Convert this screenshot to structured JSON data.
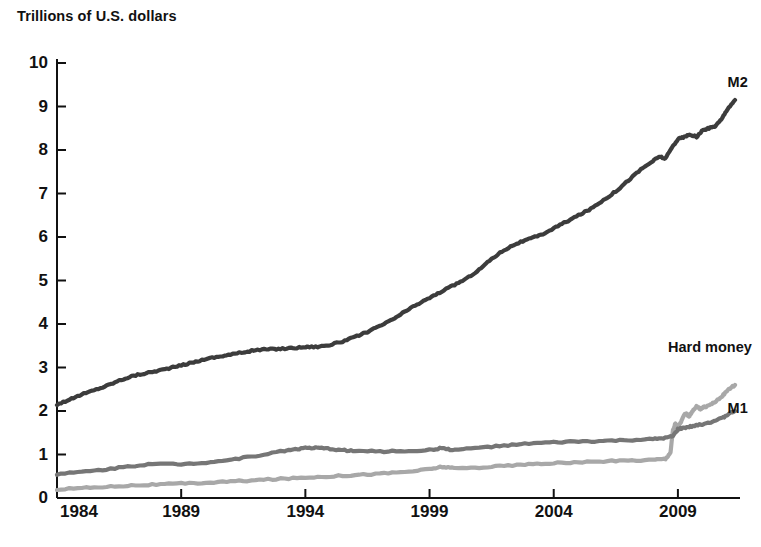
{
  "chart_data": {
    "type": "line",
    "title": "Trillions of U.S. dollars",
    "xlabel": "",
    "ylabel": "Trillions of U.S. dollars",
    "xlim": [
      1984,
      2011.5
    ],
    "ylim": [
      0,
      10
    ],
    "grid": false,
    "legend_position": "inline-right-labels",
    "x_ticks": [
      1984,
      1989,
      1994,
      1999,
      2004,
      2009
    ],
    "x_tick_labels": [
      "1984",
      "1989",
      "1994",
      "1999",
      "2004",
      "2009"
    ],
    "y_ticks": [
      0,
      1,
      2,
      3,
      4,
      5,
      6,
      7,
      8,
      9,
      10
    ],
    "y_tick_labels": [
      "0",
      "1",
      "2",
      "3",
      "4",
      "5",
      "6",
      "7",
      "8",
      "9",
      "10"
    ],
    "series": [
      {
        "name": "M2",
        "color": "#3c3c3c",
        "label_x": 2011.0,
        "label_y": 9.55,
        "x": [
          1984.0,
          1984.5,
          1985.0,
          1985.5,
          1986.0,
          1986.5,
          1987.0,
          1987.5,
          1988.0,
          1988.5,
          1989.0,
          1989.5,
          1990.0,
          1990.5,
          1991.0,
          1991.5,
          1992.0,
          1992.5,
          1993.0,
          1993.5,
          1994.0,
          1994.5,
          1995.0,
          1995.5,
          1996.0,
          1996.5,
          1997.0,
          1997.5,
          1998.0,
          1998.5,
          1999.0,
          1999.5,
          2000.0,
          2000.5,
          2001.0,
          2001.5,
          2002.0,
          2002.5,
          2003.0,
          2003.5,
          2004.0,
          2004.5,
          2005.0,
          2005.5,
          2006.0,
          2006.5,
          2007.0,
          2007.5,
          2008.0,
          2008.25,
          2008.5,
          2008.75,
          2009.0,
          2009.25,
          2009.5,
          2009.75,
          2010.0,
          2010.25,
          2010.5,
          2010.75,
          2011.0,
          2011.3
        ],
        "y": [
          2.15,
          2.26,
          2.38,
          2.48,
          2.58,
          2.7,
          2.8,
          2.86,
          2.92,
          2.98,
          3.05,
          3.12,
          3.2,
          3.25,
          3.3,
          3.35,
          3.4,
          3.42,
          3.43,
          3.45,
          3.47,
          3.48,
          3.52,
          3.6,
          3.7,
          3.82,
          3.95,
          4.1,
          4.28,
          4.45,
          4.6,
          4.75,
          4.9,
          5.05,
          5.25,
          5.5,
          5.7,
          5.85,
          5.95,
          6.05,
          6.2,
          6.35,
          6.5,
          6.65,
          6.85,
          7.05,
          7.3,
          7.55,
          7.75,
          7.85,
          7.8,
          8.05,
          8.25,
          8.3,
          8.35,
          8.3,
          8.45,
          8.5,
          8.55,
          8.7,
          8.95,
          9.15
        ]
      },
      {
        "name": "Hard money",
        "color": "#a8a8a8",
        "label_x": 2008.6,
        "label_y": 3.45,
        "x": [
          1984.0,
          1985.0,
          1986.0,
          1987.0,
          1988.0,
          1989.0,
          1990.0,
          1991.0,
          1992.0,
          1993.0,
          1994.0,
          1995.0,
          1996.0,
          1997.0,
          1998.0,
          1999.0,
          1999.5,
          2000.0,
          2001.0,
          2002.0,
          2003.0,
          2004.0,
          2005.0,
          2006.0,
          2007.0,
          2008.0,
          2008.5,
          2008.7,
          2008.8,
          2008.9,
          2009.0,
          2009.15,
          2009.3,
          2009.45,
          2009.6,
          2009.75,
          2009.9,
          2010.0,
          2010.2,
          2010.4,
          2010.6,
          2010.8,
          2011.0,
          2011.3
        ],
        "y": [
          0.2,
          0.23,
          0.26,
          0.29,
          0.31,
          0.33,
          0.35,
          0.38,
          0.41,
          0.44,
          0.47,
          0.5,
          0.53,
          0.56,
          0.6,
          0.66,
          0.72,
          0.68,
          0.7,
          0.74,
          0.77,
          0.8,
          0.82,
          0.84,
          0.86,
          0.88,
          0.9,
          1.05,
          1.55,
          1.72,
          1.62,
          1.78,
          1.95,
          1.88,
          2.0,
          2.1,
          2.05,
          2.08,
          2.12,
          2.18,
          2.25,
          2.35,
          2.48,
          2.6
        ]
      },
      {
        "name": "M1",
        "color": "#767676",
        "label_x": 2011.0,
        "label_y": 2.05,
        "x": [
          1984.0,
          1985.0,
          1986.0,
          1987.0,
          1988.0,
          1989.0,
          1990.0,
          1991.0,
          1992.0,
          1993.0,
          1993.5,
          1994.0,
          1994.5,
          1995.0,
          1995.5,
          1996.0,
          1997.0,
          1998.0,
          1999.0,
          1999.5,
          2000.0,
          2001.0,
          2002.0,
          2003.0,
          2004.0,
          2005.0,
          2006.0,
          2007.0,
          2008.0,
          2008.5,
          2008.8,
          2009.0,
          2009.3,
          2009.6,
          2010.0,
          2010.4,
          2010.8,
          2011.0,
          2011.3
        ],
        "y": [
          0.55,
          0.6,
          0.66,
          0.74,
          0.78,
          0.78,
          0.82,
          0.88,
          0.97,
          1.07,
          1.12,
          1.15,
          1.15,
          1.13,
          1.1,
          1.08,
          1.07,
          1.08,
          1.1,
          1.15,
          1.1,
          1.16,
          1.2,
          1.25,
          1.28,
          1.3,
          1.31,
          1.33,
          1.35,
          1.38,
          1.42,
          1.58,
          1.62,
          1.65,
          1.7,
          1.76,
          1.84,
          1.92,
          2.0
        ]
      }
    ]
  },
  "axis": {
    "y_title": "Trillions of U.S. dollars"
  }
}
